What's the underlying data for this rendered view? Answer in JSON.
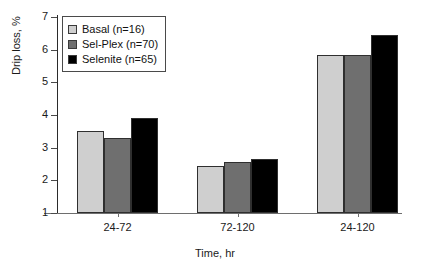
{
  "chart_data": {
    "type": "bar",
    "title": "",
    "xlabel": "Time, hr",
    "ylabel": "Drip loss, %",
    "categories": [
      "24-72",
      "72-120",
      "24-120"
    ],
    "ylim": [
      1,
      7
    ],
    "yticks": [
      1,
      2,
      3,
      4,
      5,
      6,
      7
    ],
    "ytick_labels": [
      "1",
      "2",
      "3",
      "4",
      "5",
      "6",
      "7"
    ],
    "grid": false,
    "legend_position": "top-left",
    "series": [
      {
        "name": "Basal (n=16)",
        "short_name": "Basal",
        "n": 16,
        "color": "#cfcfcf",
        "values": [
          3.5,
          2.45,
          5.85
        ]
      },
      {
        "name": "Sel-Plex (n=70)",
        "short_name": "Sel-Plex",
        "n": 70,
        "color": "#6f6f6f",
        "values": [
          3.3,
          2.55,
          5.85
        ]
      },
      {
        "name": "Selenite (n=65)",
        "short_name": "Selenite",
        "n": 65,
        "color": "#000000",
        "values": [
          3.9,
          2.65,
          6.45
        ]
      }
    ]
  },
  "axes": {
    "y_title": "Drip loss, %",
    "x_title": "Time, hr",
    "y_labels": [
      "7",
      "6",
      "5",
      "4",
      "3",
      "2",
      "1"
    ],
    "x_labels": [
      "24-72",
      "72-120",
      "24-120"
    ]
  },
  "legend": {
    "entries": [
      {
        "label": "Basal (n=16)",
        "color": "#cfcfcf"
      },
      {
        "label": "Sel-Plex (n=70)",
        "color": "#6f6f6f"
      },
      {
        "label": "Selenite (n=65)",
        "color": "#000000"
      }
    ]
  }
}
